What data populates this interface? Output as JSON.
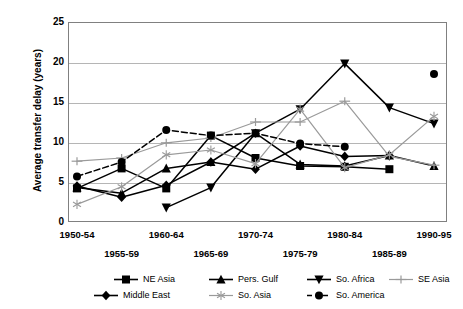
{
  "chart_data": {
    "type": "line",
    "title": "",
    "xlabel": "",
    "ylabel": "Average transfer delay (years)",
    "categories": [
      "1950-54",
      "1955-59",
      "1960-64",
      "1965-69",
      "1970-74",
      "1975-79",
      "1980-84",
      "1985-89",
      "1990-95"
    ],
    "ylim": [
      0,
      25
    ],
    "yticks": [
      0,
      5,
      10,
      15,
      20,
      25
    ],
    "grid": true,
    "legend_position": "bottom",
    "series": [
      {
        "name": "NE Asia",
        "marker": "filled-square",
        "color": "#000000",
        "style": "solid",
        "values": [
          4.2,
          6.7,
          4.2,
          10.8,
          8.0,
          7.0,
          6.9,
          6.6,
          null
        ]
      },
      {
        "name": "Pers. Gulf",
        "marker": "filled-triangle-up",
        "color": "#000000",
        "style": "solid",
        "values": [
          4.3,
          3.6,
          6.7,
          7.5,
          11.1,
          7.2,
          7.0,
          8.3,
          7.0
        ]
      },
      {
        "name": "So. Africa",
        "marker": "filled-triangle-down",
        "color": "#000000",
        "style": "solid",
        "values": [
          null,
          null,
          1.8,
          4.3,
          11.1,
          14.1,
          19.8,
          14.3,
          12.3
        ]
      },
      {
        "name": "SE Asia",
        "marker": "gray-plus",
        "color": "#9a9a9a",
        "style": "solid",
        "values": [
          7.6,
          8.0,
          9.9,
          10.5,
          12.5,
          12.5,
          15.1,
          8.2,
          7.1
        ]
      },
      {
        "name": "Middle East",
        "marker": "filled-diamond",
        "color": "#000000",
        "style": "solid",
        "values": [
          4.5,
          3.1,
          4.6,
          7.5,
          6.6,
          9.5,
          8.2,
          8.3,
          null
        ]
      },
      {
        "name": "So. Asia",
        "marker": "gray-asterisk",
        "color": "#9a9a9a",
        "style": "solid",
        "values": [
          2.2,
          4.4,
          8.4,
          9.0,
          7.3,
          14.1,
          6.8,
          8.4,
          13.2
        ]
      },
      {
        "name": "So. America",
        "marker": "filled-circle",
        "color": "#000000",
        "style": "dashed",
        "values": [
          5.7,
          7.5,
          11.5,
          10.8,
          11.1,
          9.8,
          9.4,
          null,
          18.5
        ]
      }
    ]
  },
  "axis": {
    "y_title": "Average transfer delay (years)",
    "y_labels": [
      "0",
      "5",
      "10",
      "15",
      "20",
      "25"
    ],
    "x_labels": [
      "1950-54",
      "1955-59",
      "1960-64",
      "1965-69",
      "1970-74",
      "1975-79",
      "1980-84",
      "1985-89",
      "1990-95"
    ]
  },
  "legend": {
    "items": [
      {
        "label": "NE Asia"
      },
      {
        "label": "Pers. Gulf"
      },
      {
        "label": "So. Africa"
      },
      {
        "label": "SE Asia"
      },
      {
        "label": "Middle East"
      },
      {
        "label": "So. Asia"
      },
      {
        "label": "So. America"
      }
    ]
  }
}
